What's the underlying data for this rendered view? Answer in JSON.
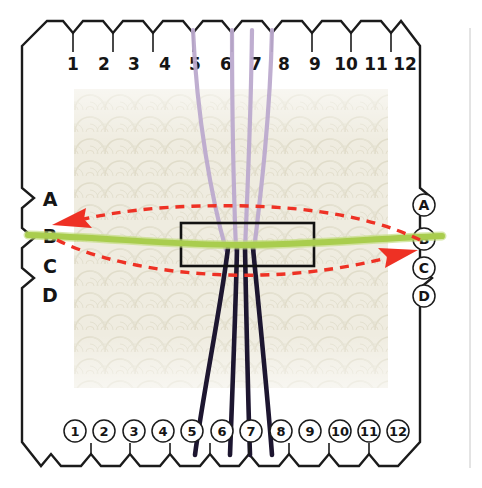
{
  "diagram": {
    "top_labels": [
      "1",
      "2",
      "3",
      "4",
      "5",
      "6",
      "7",
      "8",
      "9",
      "10",
      "11",
      "12"
    ],
    "bottom_labels": [
      "1",
      "2",
      "3",
      "4",
      "5",
      "6",
      "7",
      "8",
      "9",
      "10",
      "11",
      "12"
    ],
    "left_labels": [
      "A",
      "B",
      "C",
      "D"
    ],
    "right_labels": [
      "A",
      "B",
      "C",
      "D"
    ],
    "top_label_style": "plain",
    "bottom_label_style": "circled",
    "left_label_style": "plain",
    "right_label_style": "circled",
    "colors": {
      "warp_upper": "#bcaacd",
      "warp_lower": "#1d1630",
      "weft": "#a9cd4e",
      "arrow": "#ee3124",
      "frame": "#1b1b1b",
      "fabric": "#ece9dc",
      "page": "#ffffff"
    },
    "threads": {
      "upper_warp_positions": [
        "5",
        "6",
        "7",
        "8"
      ],
      "lower_warp_positions": [
        "5",
        "6",
        "7",
        "8"
      ],
      "weft_row": "B",
      "upper_warp_count": 4,
      "lower_warp_count": 4
    },
    "arrows": [
      {
        "name": "weft-return-left",
        "direction": "left",
        "from": "B",
        "to": "B",
        "arc": "upper"
      },
      {
        "name": "weft-pass-right",
        "direction": "right",
        "from": "B",
        "to": "C",
        "arc": "lower"
      }
    ],
    "fabric_panel": {
      "label": "woven fabric"
    },
    "center_box": {
      "label": "shed area"
    }
  }
}
